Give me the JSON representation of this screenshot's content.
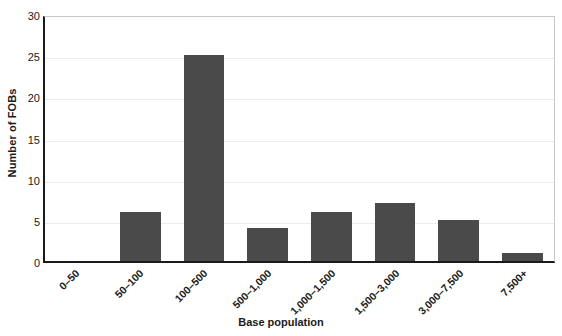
{
  "chart_data": {
    "type": "bar",
    "title": "",
    "xlabel": "Base population",
    "ylabel": "Number of FOBs",
    "categories": [
      "0–50",
      "50–100",
      "100–500",
      "500–1,000",
      "1,000–1,500",
      "1,500–3,000",
      "3,000–7,500",
      "7,500+"
    ],
    "values": [
      0,
      6,
      25,
      4,
      6,
      7,
      5,
      1
    ],
    "ylim": [
      0,
      30
    ],
    "yticks": [
      0,
      5,
      10,
      15,
      20,
      25,
      30
    ],
    "ytick_labels": [
      "0",
      "5",
      "10",
      "15",
      "20",
      "25",
      "30"
    ],
    "grid": "horizontal",
    "legend": "none",
    "bar_color": "#4a4a4a",
    "gridline_color": "#ebebeb",
    "axis_color": "#1a1a1a",
    "plot_border_color": "#c8c8c8",
    "background_color": "#ffffff"
  }
}
